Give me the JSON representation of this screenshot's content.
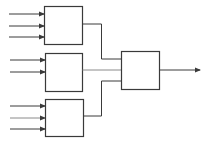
{
  "diagram": {
    "type": "block-diagram",
    "blocks": [
      {
        "id": "block-1",
        "label": "",
        "inputs": 3
      },
      {
        "id": "block-2",
        "label": "",
        "inputs": 2
      },
      {
        "id": "block-3",
        "label": "",
        "inputs": 3
      },
      {
        "id": "block-4",
        "label": "",
        "inputs": 3,
        "outputs": 1
      }
    ],
    "connections": [
      {
        "from": "block-1",
        "to": "block-4"
      },
      {
        "from": "block-2",
        "to": "block-4"
      },
      {
        "from": "block-3",
        "to": "block-4"
      },
      {
        "from": "block-4",
        "to": "output"
      }
    ],
    "colors": {
      "line": "#3a3a3a",
      "middle_wire": "#8a8a8a",
      "background": "#ffffff"
    }
  }
}
